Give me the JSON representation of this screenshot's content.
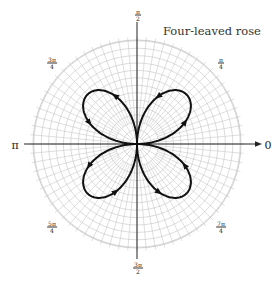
{
  "diagram": {
    "title": "Four-leaved rose",
    "center": [
      137,
      144
    ],
    "grid_radius": 104,
    "curve_scale": 70,
    "equation_note": "r = sin 2θ",
    "colors": {
      "grid": "#c4c4c4",
      "curve": "#111111",
      "axis": "#222222"
    },
    "axis_labels": {
      "zero": "0",
      "pi": "π"
    },
    "angle_labels": [
      {
        "id": "pi-over-2",
        "num": "π",
        "den": "2",
        "x": 138,
        "y": 15
      },
      {
        "id": "3pi-over-4",
        "num": "3π",
        "den": "4",
        "x": 52,
        "y": 63
      },
      {
        "id": "pi-over-4",
        "num": "π",
        "den": "4",
        "x": 221,
        "y": 63
      },
      {
        "id": "5pi-over-4",
        "num": "5π",
        "den": "4",
        "x": 52,
        "y": 227
      },
      {
        "id": "7pi-over-4",
        "num": "7π",
        "den": "4",
        "x": 221,
        "y": 227
      },
      {
        "id": "3pi-over-2",
        "num": "3π",
        "den": "2",
        "x": 138,
        "y": 268
      }
    ],
    "petals": [
      {
        "name": "petal-quadrant-1",
        "theta_start": 0,
        "theta_end": 90
      },
      {
        "name": "petal-quadrant-2",
        "theta_start": 90,
        "theta_end": 180
      },
      {
        "name": "petal-quadrant-3",
        "theta_start": 180,
        "theta_end": 270
      },
      {
        "name": "petal-quadrant-4",
        "theta_start": 270,
        "theta_end": 360
      }
    ],
    "direction": "counterclockwise"
  }
}
